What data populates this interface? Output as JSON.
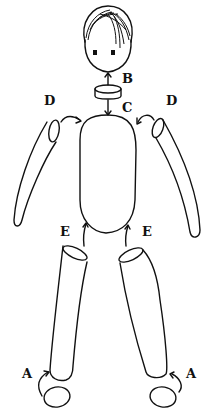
{
  "diagram": {
    "type": "doll assembly diagram",
    "parts": [
      "head",
      "neck",
      "torso",
      "left-arm",
      "right-arm",
      "left-leg",
      "right-leg",
      "left-foot",
      "right-foot"
    ],
    "labels": {
      "A_left": "A",
      "A_right": "A",
      "B": "B",
      "C": "C",
      "D_left": "D",
      "D_right": "D",
      "E_left": "E",
      "E_right": "E"
    },
    "connections": [
      {
        "label": "A",
        "from": "foot",
        "to": "leg bottom"
      },
      {
        "label": "B",
        "from": "neck",
        "to": "head"
      },
      {
        "label": "C",
        "from": "neck",
        "to": "torso top"
      },
      {
        "label": "D",
        "from": "arm top",
        "to": "torso shoulder"
      },
      {
        "label": "E",
        "from": "leg top",
        "to": "torso bottom"
      }
    ],
    "colors": {
      "line": "#111111",
      "background": "#ffffff"
    }
  }
}
